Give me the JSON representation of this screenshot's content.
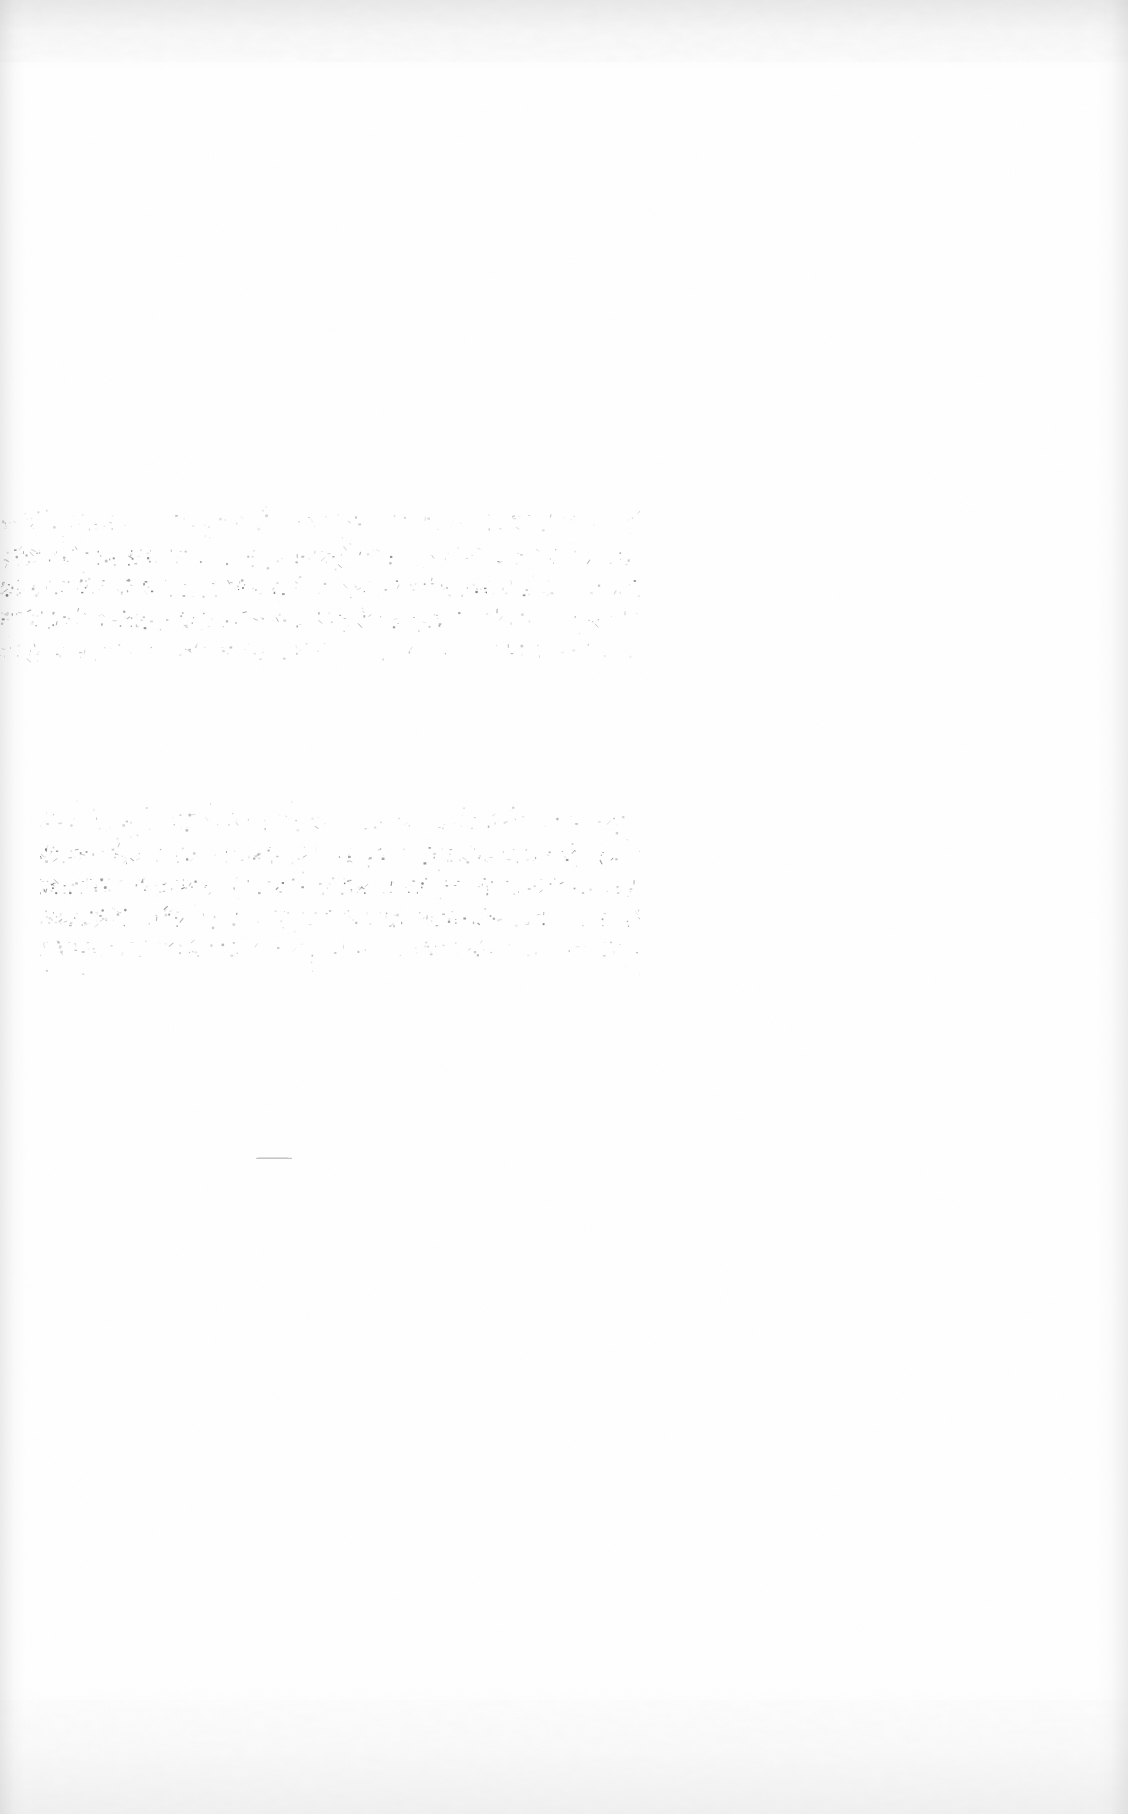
{
  "document": {
    "kind": "scanned-page",
    "condition": "blank-faded",
    "page_background_color": "#ffffff",
    "ink_color": "#4a4a4a",
    "edge_shade_color": "#a5a5a5",
    "width_px": 1128,
    "height_px": 1814,
    "visible_text": "",
    "note": ""
  },
  "marks": [
    {
      "name": "faded-text-band-upper",
      "label": "",
      "x": 0,
      "y": 500,
      "width": 640,
      "height": 175,
      "density": 0.55,
      "seed": 17
    },
    {
      "name": "faded-text-band-lower",
      "label": "",
      "x": 40,
      "y": 800,
      "width": 600,
      "height": 175,
      "density": 0.62,
      "seed": 43
    },
    {
      "name": "dash-mark",
      "label": "",
      "x": 256,
      "y": 1146,
      "width": 36,
      "height": 3
    }
  ]
}
